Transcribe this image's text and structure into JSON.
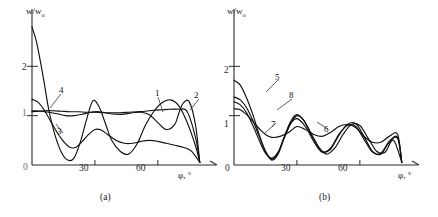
{
  "figure": {
    "ylabel": "w/w",
    "ylabel_sub": "o",
    "xlabel": "φ, °"
  },
  "panels": [
    {
      "id": "a",
      "caption": "(a)",
      "xticks": [
        "0",
        "30",
        "60"
      ],
      "yticks": [
        "1",
        "2"
      ],
      "curve_labels": [
        "1",
        "2",
        "3",
        "4"
      ]
    },
    {
      "id": "b",
      "caption": "(b)",
      "xticks": [
        "0",
        "30",
        "60"
      ],
      "yticks": [
        "1",
        "2"
      ],
      "curve_labels": [
        "5",
        "6",
        "7",
        "8"
      ]
    }
  ],
  "chart_data": {
    "type": "line",
    "title": "",
    "xlabel": "φ, °",
    "ylabel": "w/w₀",
    "xlim": [
      0,
      82
    ],
    "ylim": [
      0,
      3.0
    ],
    "grid": false,
    "legend": "inline-curve-numbers",
    "subplots": [
      {
        "panel": "a",
        "caption": "(a)",
        "xticks": [
          0,
          30,
          60
        ],
        "yticks": [
          1,
          2
        ],
        "series": [
          {
            "name": "1",
            "label_position": [
              57,
              1.28
            ],
            "x": [
              0,
              3,
              6,
              10,
              14,
              18,
              22,
              26,
              30,
              34,
              38,
              42,
              46,
              50,
              54,
              58,
              62,
              66,
              70,
              74,
              78,
              80
            ],
            "y": [
              1.08,
              1.09,
              1.1,
              1.1,
              1.09,
              1.08,
              1.08,
              1.07,
              1.07,
              1.06,
              1.06,
              1.06,
              1.07,
              1.08,
              1.09,
              1.11,
              1.12,
              1.13,
              1.13,
              1.08,
              0.55,
              0.05
            ]
          },
          {
            "name": "2",
            "label_position": [
              74,
              1.33
            ],
            "x": [
              0,
              4,
              8,
              12,
              16,
              20,
              24,
              28,
              32,
              36,
              40,
              44,
              48,
              52,
              56,
              60,
              64,
              68,
              70,
              72,
              75,
              78,
              80
            ],
            "y": [
              1.1,
              1.09,
              1.07,
              1.04,
              1.0,
              1.0,
              1.03,
              1.07,
              1.08,
              1.05,
              1.03,
              1.03,
              1.06,
              1.07,
              1.02,
              0.86,
              0.72,
              0.82,
              1.05,
              1.25,
              1.28,
              0.8,
              0.05
            ]
          },
          {
            "name": "3",
            "label_position": [
              14,
              0.72
            ],
            "x": [
              0,
              3,
              6,
              9,
              12,
              15,
              18,
              21,
              24,
              27,
              30,
              33,
              36,
              40,
              44,
              48,
              52,
              56,
              60,
              64,
              68,
              72,
              76,
              80
            ],
            "y": [
              1.33,
              1.27,
              1.1,
              0.88,
              0.66,
              0.48,
              0.36,
              0.36,
              0.48,
              0.62,
              0.72,
              0.71,
              0.62,
              0.5,
              0.44,
              0.44,
              0.48,
              0.5,
              0.48,
              0.44,
              0.4,
              0.36,
              0.28,
              0.05
            ]
          },
          {
            "name": "4",
            "label_position": [
              10,
              1.82
            ],
            "x": [
              0,
              2,
              4,
              6,
              8,
              11,
              14,
              17,
              20,
              23,
              26,
              29,
              32,
              35,
              38,
              42,
              46,
              50,
              54,
              58,
              62,
              66,
              70,
              74,
              78,
              80
            ],
            "y": [
              2.8,
              2.52,
              2.1,
              1.62,
              1.12,
              0.6,
              0.26,
              0.1,
              0.14,
              0.46,
              0.92,
              1.3,
              1.18,
              0.84,
              0.5,
              0.28,
              0.22,
              0.42,
              0.8,
              1.08,
              1.26,
              1.32,
              1.2,
              0.86,
              0.38,
              0.05
            ]
          }
        ]
      },
      {
        "panel": "b",
        "caption": "(b)",
        "xticks": [
          0,
          30,
          60
        ],
        "yticks": [
          1,
          2
        ],
        "series": [
          {
            "name": "5",
            "label_position": [
              8,
              1.8
            ],
            "x": [
              0,
              3,
              6,
              9,
              12,
              15,
              18,
              21,
              24,
              27,
              30,
              33,
              36,
              40,
              44,
              48,
              52,
              56,
              60,
              64,
              68,
              72,
              76,
              80
            ],
            "y": [
              1.72,
              1.62,
              1.36,
              1.02,
              0.62,
              0.28,
              0.1,
              0.22,
              0.55,
              0.84,
              1.0,
              0.92,
              0.68,
              0.38,
              0.22,
              0.34,
              0.62,
              0.82,
              0.8,
              0.54,
              0.28,
              0.26,
              0.5,
              0.05
            ]
          },
          {
            "name": "6",
            "label_position": [
              43,
              0.92
            ],
            "x": [
              0,
              3,
              6,
              9,
              12,
              15,
              18,
              22,
              26,
              30,
              34,
              38,
              42,
              46,
              50,
              54,
              58,
              62,
              66,
              70,
              74,
              78,
              80
            ],
            "y": [
              1.14,
              1.12,
              1.02,
              0.88,
              0.74,
              0.62,
              0.56,
              0.58,
              0.66,
              0.78,
              0.72,
              0.62,
              0.58,
              0.66,
              0.78,
              0.82,
              0.76,
              0.58,
              0.46,
              0.46,
              0.58,
              0.62,
              0.05
            ]
          },
          {
            "name": "7",
            "label_position": [
              20,
              1.0
            ],
            "x": [
              0,
              3,
              6,
              9,
              12,
              15,
              18,
              21,
              24,
              27,
              30,
              34,
              38,
              42,
              46,
              50,
              54,
              58,
              62,
              66,
              70,
              74,
              78,
              80
            ],
            "y": [
              1.28,
              1.22,
              1.06,
              0.8,
              0.5,
              0.24,
              0.14,
              0.26,
              0.56,
              0.84,
              0.94,
              0.78,
              0.48,
              0.26,
              0.34,
              0.62,
              0.8,
              0.78,
              0.52,
              0.26,
              0.24,
              0.48,
              0.56,
              0.05
            ]
          },
          {
            "name": "8",
            "label_position": [
              12,
              1.52
            ],
            "x": [
              0,
              3,
              6,
              9,
              12,
              15,
              18,
              21,
              24,
              27,
              30,
              34,
              38,
              42,
              46,
              50,
              54,
              58,
              62,
              66,
              70,
              74,
              78,
              80
            ],
            "y": [
              1.38,
              1.32,
              1.16,
              0.9,
              0.58,
              0.28,
              0.12,
              0.24,
              0.58,
              0.88,
              1.02,
              0.86,
              0.54,
              0.28,
              0.32,
              0.6,
              0.82,
              0.84,
              0.58,
              0.28,
              0.22,
              0.46,
              0.54,
              0.05
            ]
          }
        ]
      }
    ]
  }
}
